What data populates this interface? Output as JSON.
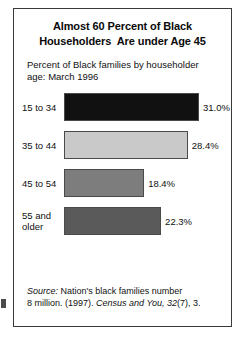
{
  "title": {
    "line1": "Almost 60 Percent of Black",
    "line2": "Householders  Are under Age 45"
  },
  "subtitle": {
    "line1": "Percent of Black families by householder",
    "line2": "age: March 1996"
  },
  "source": {
    "label": "Source:",
    "text1": " Nation's black families number",
    "text2": "8 million. (1997). ",
    "publication": "Census and You,",
    "volume": " 32",
    "text3": "(7), 3."
  },
  "chart_data": {
    "type": "bar",
    "orientation": "horizontal",
    "title": "Almost 60 Percent of Black Householders  Are under Age 45",
    "subtitle": "Percent of Black families by householder age: March 1996",
    "xlabel": "",
    "ylabel": "",
    "categories": [
      "15 to 34",
      "35 to 44",
      "45 to 54",
      "55 and older"
    ],
    "category_lines": [
      [
        "15 to 34"
      ],
      [
        "35 to 44"
      ],
      [
        "45 to 54"
      ],
      [
        "55 and",
        "older"
      ]
    ],
    "values": [
      31.0,
      28.4,
      18.4,
      22.3
    ],
    "value_labels": [
      "31.0%",
      "28.4%",
      "18.4%",
      "22.3%"
    ],
    "colors": [
      "#111111",
      "#c9c9c9",
      "#7d7d7d",
      "#5a5a5a"
    ],
    "xlim": [
      0,
      31.0
    ],
    "grid": false,
    "legend": false
  }
}
